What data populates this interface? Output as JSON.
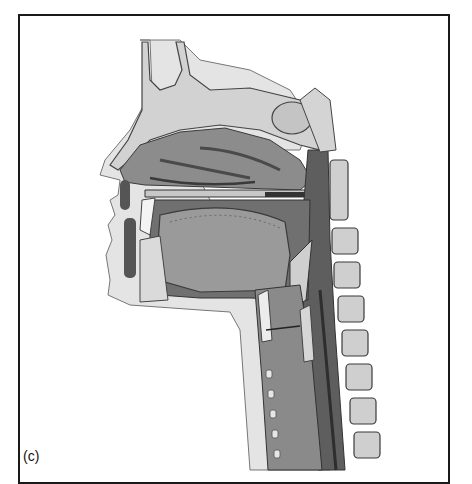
{
  "figure": {
    "panel_label": "(c)",
    "palette": {
      "border": "#1a1a1a",
      "bone_light": "#d9d9d9",
      "tissue_mid": "#9a9a9a",
      "cavity_dark": "#5a5a5a",
      "skin": "#e4e4e4",
      "outline": "#3a3a3a"
    }
  }
}
